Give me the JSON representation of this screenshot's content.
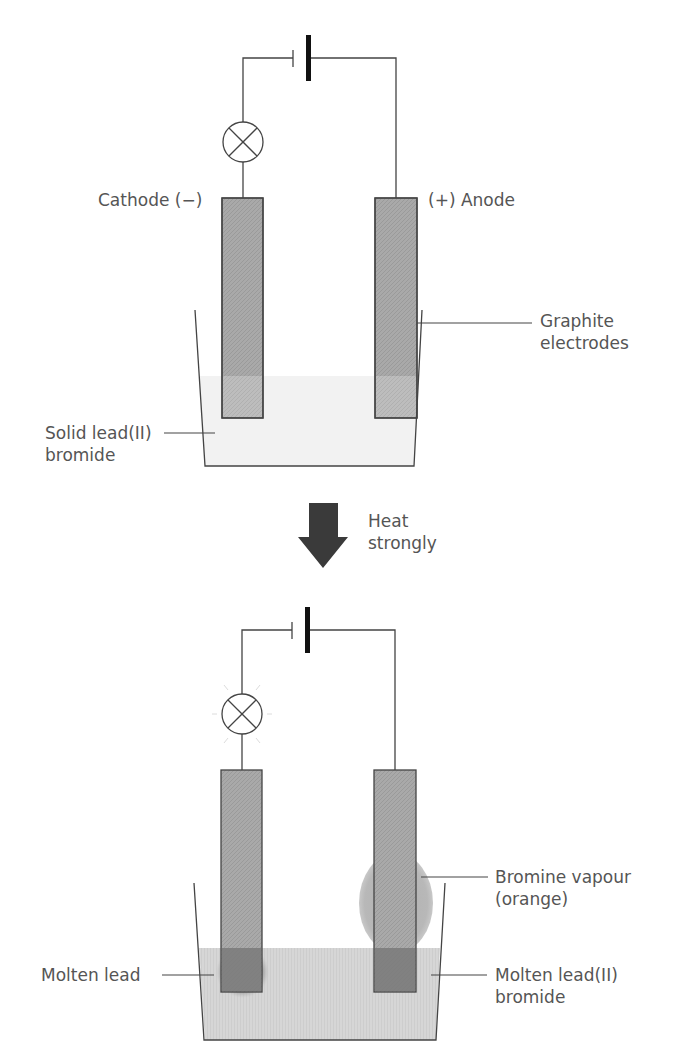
{
  "diagram": {
    "colors": {
      "line": "#444444",
      "electrode": "#a8a8a8",
      "electrode_dark": "#7d7d7d",
      "solid_fill": "#f3f3f3",
      "molten_fill": "#d4d4d4",
      "vapour": "#b5b5b5",
      "arrow": "#3a3a3a",
      "text": "#555555"
    },
    "top_panel": {
      "state": "solid",
      "labels": {
        "cathode": "Cathode (−)",
        "anode": "(+) Anode",
        "graphite_line1": "Graphite",
        "graphite_line2": "electrodes",
        "solid_line1": "Solid lead(II)",
        "solid_line2": "bromide"
      }
    },
    "transition": {
      "arrow": "down-arrow",
      "label_line1": "Heat",
      "label_line2": "strongly"
    },
    "bottom_panel": {
      "state": "molten",
      "bulb_lit": true,
      "labels": {
        "bromine_line1": "Bromine vapour",
        "bromine_line2": "(orange)",
        "molten_lead": "Molten lead",
        "molten_bromide_line1": "Molten lead(II)",
        "molten_bromide_line2": "bromide"
      }
    }
  }
}
